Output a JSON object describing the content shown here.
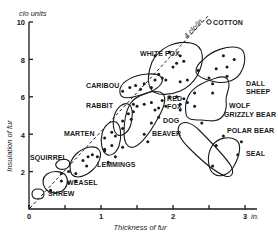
{
  "chart_data": {
    "type": "scatter",
    "title": "",
    "xlabel": "Thickness of fur",
    "ylabel": "Insulation of fur",
    "x_unit": "in.",
    "y_unit": "clo units",
    "xlim": [
      0,
      3
    ],
    "ylim": [
      0,
      10
    ],
    "x_ticks": [
      0,
      0.5,
      1,
      1.5,
      2,
      2.5,
      3
    ],
    "x_tick_labels": [
      "0",
      "",
      "1",
      "",
      "2",
      "",
      "3"
    ],
    "y_ticks": [
      2,
      4,
      6,
      8,
      10
    ],
    "y_tick_labels": [
      "2",
      "4",
      "6",
      "8",
      "10"
    ],
    "grid": false,
    "legend": "none",
    "reference_line": {
      "label": "4 clo/in.",
      "slope": 4,
      "style": "dashed"
    },
    "reference_point": {
      "label": "COTTON",
      "x": 2.5,
      "y": 10
    },
    "groups": [
      {
        "name": "SHREW",
        "points": [
          [
            0.3,
            1.0
          ]
        ]
      },
      {
        "name": "WEASEL",
        "points": [
          [
            0.45,
            1.9
          ],
          [
            0.55,
            2.0
          ],
          [
            0.65,
            1.9
          ],
          [
            0.45,
            1.5
          ],
          [
            0.55,
            1.4
          ],
          [
            0.65,
            1.5
          ]
        ]
      },
      {
        "name": "SQUIRREL",
        "points": [
          [
            0.75,
            2.6
          ],
          [
            0.82,
            2.8
          ],
          [
            0.88,
            2.9
          ]
        ]
      },
      {
        "name": "LEMMINGS",
        "points": [
          [
            0.8,
            2.3
          ],
          [
            0.95,
            2.8
          ],
          [
            1.05,
            3.2
          ],
          [
            1.15,
            3.4
          ],
          [
            1.2,
            2.8
          ],
          [
            1.1,
            2.5
          ],
          [
            1.05,
            3.1
          ]
        ]
      },
      {
        "name": "MARTEN",
        "points": [
          [
            1.05,
            3.8
          ],
          [
            1.15,
            4.1
          ],
          [
            1.2,
            3.9
          ],
          [
            1.3,
            3.3
          ],
          [
            1.3,
            4.3
          ]
        ]
      },
      {
        "name": "RABBIT",
        "points": [
          [
            1.3,
            4.7
          ],
          [
            1.38,
            5.1
          ],
          [
            1.45,
            5.2
          ],
          [
            1.42,
            4.8
          ],
          [
            1.5,
            5.5
          ],
          [
            1.45,
            5.6
          ]
        ]
      },
      {
        "name": "CARIBOU",
        "points": [
          [
            1.3,
            6.3
          ],
          [
            1.4,
            6.5
          ],
          [
            1.48,
            6.6
          ],
          [
            1.55,
            6.4
          ],
          [
            1.6,
            6.7
          ],
          [
            1.7,
            6.5
          ],
          [
            1.75,
            6.9
          ]
        ]
      },
      {
        "name": "RED FOX / DOG / BEAVER",
        "points": [
          [
            1.6,
            5.6
          ],
          [
            1.7,
            5.7
          ],
          [
            1.75,
            5.3
          ],
          [
            1.8,
            5.4
          ],
          [
            1.85,
            5.8
          ],
          [
            1.9,
            5.5
          ],
          [
            1.95,
            6.0
          ],
          [
            1.7,
            4.6
          ],
          [
            1.8,
            4.9
          ],
          [
            1.6,
            4.0
          ],
          [
            1.65,
            3.6
          ]
        ]
      },
      {
        "name": "WHITE FOX",
        "points": [
          [
            1.75,
            8.2
          ],
          [
            1.95,
            8.4
          ],
          [
            2.05,
            7.8
          ],
          [
            2.1,
            8.2
          ],
          [
            2.0,
            7.6
          ],
          [
            2.15,
            7.9
          ],
          [
            1.8,
            7.2
          ],
          [
            1.85,
            7.0
          ],
          [
            1.9,
            6.9
          ],
          [
            2.1,
            6.8
          ],
          [
            2.2,
            6.9
          ]
        ]
      },
      {
        "name": "DALL SHEEP",
        "points": [
          [
            2.35,
            7.4
          ],
          [
            2.6,
            7.5
          ],
          [
            2.75,
            7.6
          ],
          [
            2.75,
            7.1
          ],
          [
            2.7,
            8.2
          ],
          [
            2.85,
            8.0
          ]
        ]
      },
      {
        "name": "WOLF / GRIZZLY BEAR",
        "points": [
          [
            2.5,
            7.0
          ],
          [
            2.55,
            6.7
          ],
          [
            2.55,
            6.2
          ],
          [
            2.3,
            6.2
          ],
          [
            2.05,
            6.0
          ],
          [
            2.1,
            5.6
          ],
          [
            2.15,
            5.9
          ],
          [
            2.2,
            5.7
          ],
          [
            2.3,
            5.5
          ]
        ]
      },
      {
        "name": "POLAR BEAR",
        "points": [
          [
            2.1,
            5.3
          ],
          [
            2.4,
            4.6
          ],
          [
            2.7,
            3.9
          ]
        ]
      },
      {
        "name": "SEAL",
        "points": [
          [
            2.6,
            3.4
          ],
          [
            2.55,
            2.3
          ],
          [
            2.9,
            2.9
          ],
          [
            2.95,
            3.6
          ]
        ]
      }
    ]
  },
  "labels": {
    "y_unit": "clo units",
    "x_unit": "in.",
    "xlabel": "Thickness of fur",
    "ylabel": "Insulation of fur",
    "ref_line": "4 clo/in.",
    "cotton": "COTTON",
    "white_fox": "WHITE FOX",
    "dall": "DALL",
    "sheep": "SHEEP",
    "wolf": "WOLF",
    "grizzly": "GRIZZLY BEAR",
    "caribou": "CARIBOU",
    "rabbit": "RABBIT",
    "red": "RED",
    "fox": "FOX",
    "polar": "POLAR BEAR",
    "dog": "DOG",
    "beaver": "BEAVER",
    "marten": "MARTEN",
    "squirrel": "SQUIRREL",
    "lemmings": "LEMMINGS",
    "weasel": "WEASEL",
    "shrew": "SHREW",
    "seal": "SEAL"
  }
}
